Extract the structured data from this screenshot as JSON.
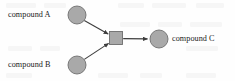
{
  "diagram": {
    "type": "reaction-network",
    "title": "",
    "background_color": "#fefefe",
    "node_fill_color": "#a9a9a9",
    "node_stroke_color": "#6e6e6e",
    "edge_color": "#3d3d3d",
    "text_color": "#1c1c1c",
    "nodes": [
      {
        "id": "compound-a",
        "label": "compound A",
        "shape": "circle",
        "label_position": "left",
        "cx": 77,
        "cy": 15,
        "r": 9
      },
      {
        "id": "compound-b",
        "label": "compound B",
        "shape": "circle",
        "label_position": "left",
        "cx": 77,
        "cy": 65,
        "r": 9
      },
      {
        "id": "reaction-node",
        "label": "",
        "shape": "square",
        "label_position": "none",
        "cx": 116,
        "cy": 38,
        "size": 13
      },
      {
        "id": "compound-c",
        "label": "compound C",
        "shape": "circle",
        "label_position": "right",
        "cx": 159,
        "cy": 39,
        "r": 9
      }
    ],
    "edges": [
      {
        "from": "compound-a",
        "to": "reaction-node",
        "arrow": true
      },
      {
        "from": "compound-b",
        "to": "reaction-node",
        "arrow": true
      },
      {
        "from": "reaction-node",
        "to": "compound-c",
        "arrow": true
      }
    ]
  }
}
